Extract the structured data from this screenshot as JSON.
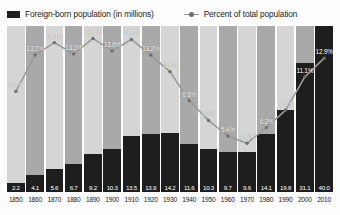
{
  "legend": {
    "bars_label": "Foreign-born population (in millions)",
    "line_label": "Percent of total population",
    "bar_swatch_icon": "bar-swatch-icon",
    "line_swatch_icon": "line-marker-icon"
  },
  "colors": {
    "bar": "#1e1e1e",
    "column_light": "#d5d5d5",
    "column_dark": "#a9a9a9",
    "line": "#9a9a9a",
    "label_text": "#ffffff",
    "axis_text": "#1a1a1a",
    "background": "#fdfdfd"
  },
  "chart_data": {
    "type": "bar",
    "title": "",
    "subtitle": "",
    "xlabel": "",
    "ylabel": "",
    "grid": false,
    "legend_position": "top",
    "categories": [
      "1850",
      "1860",
      "1870",
      "1880",
      "1890",
      "1900",
      "1910",
      "1920",
      "1930",
      "1940",
      "1950",
      "1960",
      "1970",
      "1980",
      "1990",
      "2000",
      "2010"
    ],
    "series": [
      {
        "name": "Foreign-born population (in millions)",
        "type": "bar",
        "unit": "millions",
        "values": [
          2.2,
          4.1,
          5.6,
          6.7,
          9.2,
          10.3,
          13.5,
          13.9,
          14.2,
          11.6,
          10.3,
          9.7,
          9.6,
          14.1,
          19.8,
          31.1,
          40.0
        ],
        "value_labels": [
          "2.2",
          "4.1",
          "5.6",
          "6.7",
          "9.2",
          "10.3",
          "13.5",
          "13.9",
          "14.2",
          "11.6",
          "10.3",
          "9.7",
          "9.6",
          "14.1",
          "19.8",
          "31.1",
          "40.0"
        ],
        "ylim": [
          0,
          40.0
        ]
      },
      {
        "name": "Percent of total population",
        "type": "line",
        "unit": "percent",
        "values": [
          9.7,
          13.2,
          14.4,
          13.3,
          14.8,
          13.6,
          14.7,
          13.2,
          11.6,
          8.8,
          6.9,
          5.4,
          4.7,
          6.2,
          7.9,
          11.1,
          12.9
        ],
        "value_labels": [
          "9.7%",
          "13.2%",
          "14.4%",
          "13.3%",
          "14.8%",
          "13.6%",
          "14.7%",
          "13.2%",
          "11.6%",
          "8.8%",
          "6.9%",
          "5.4%",
          "4.7%",
          "6.2%",
          "7.9%",
          "11.1%",
          "12.9%"
        ],
        "ylim": [
          0,
          16
        ]
      }
    ]
  }
}
